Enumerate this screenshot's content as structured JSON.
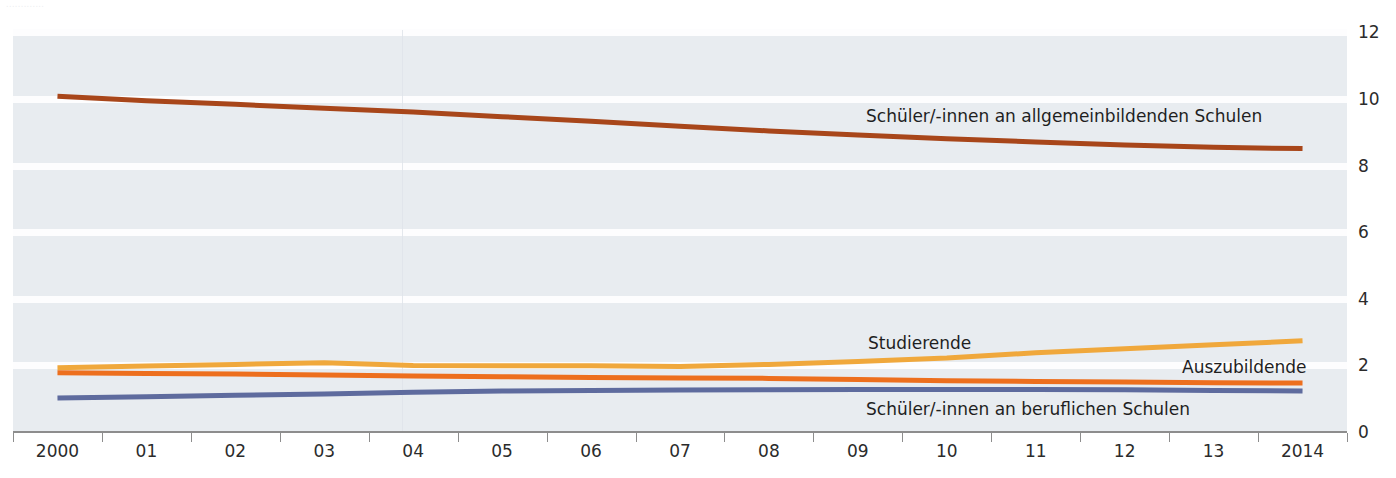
{
  "caption": {
    "top_note": "............."
  },
  "axes": {
    "y_ticks": [
      "0",
      "2",
      "4",
      "6",
      "8",
      "10",
      "12"
    ],
    "y_tick_values": [
      0,
      2,
      4,
      6,
      8,
      10,
      12
    ],
    "x_ticks": [
      "2000",
      "01",
      "02",
      "03",
      "04",
      "05",
      "06",
      "07",
      "08",
      "09",
      "10",
      "11",
      "12",
      "13",
      "2014"
    ]
  },
  "colors": {
    "background": "#e8ecf0",
    "gridband": "#fdfdfe",
    "axis": "#8d8d8d",
    "schueler_allgemeinbildend": "#a8461a",
    "studierende": "#f0a83c",
    "auszubildende": "#ed6f1e",
    "schueler_beruflich": "#5e6b9e",
    "label_text": "#1f1f1f"
  },
  "labels": {
    "schueler_allgemeinbildend": "Schüler/-innen an allgemeinbildenden Schulen",
    "studierende": "Studierende",
    "auszubildende": "Auszubildende",
    "schueler_beruflich": "Schüler/-innen an beruflichen Schulen"
  },
  "chart_data": {
    "type": "line",
    "title": "",
    "subtitle": "",
    "xlabel": "",
    "ylabel": "",
    "ylim": [
      0,
      12
    ],
    "grid": true,
    "legend_position": "inline-labels",
    "x": [
      "2000",
      "01",
      "02",
      "03",
      "04",
      "05",
      "06",
      "07",
      "08",
      "09",
      "10",
      "11",
      "12",
      "13",
      "2014"
    ],
    "x_values": [
      2000,
      2001,
      2002,
      2003,
      2004,
      2005,
      2006,
      2007,
      2008,
      2009,
      2010,
      2011,
      2012,
      2013,
      2014
    ],
    "series": [
      {
        "name": "Schüler/-innen an allgemeinbildenden Schulen",
        "color": "#a8461a",
        "values": [
          10.08,
          9.95,
          9.84,
          9.72,
          9.61,
          9.47,
          9.33,
          9.18,
          9.04,
          8.92,
          8.81,
          8.71,
          8.62,
          8.55,
          8.51
        ]
      },
      {
        "name": "Studierende",
        "color": "#f0a83c",
        "values": [
          1.93,
          1.98,
          2.03,
          2.08,
          2.0,
          1.99,
          1.99,
          1.97,
          2.03,
          2.12,
          2.22,
          2.38,
          2.5,
          2.62,
          2.74
        ]
      },
      {
        "name": "Auszubildende",
        "color": "#ed6f1e",
        "values": [
          1.78,
          1.76,
          1.74,
          1.71,
          1.68,
          1.66,
          1.64,
          1.62,
          1.61,
          1.58,
          1.54,
          1.52,
          1.5,
          1.48,
          1.47
        ]
      },
      {
        "name": "Schüler/-innen an beruflichen Schulen",
        "color": "#5e6b9e",
        "values": [
          1.02,
          1.06,
          1.1,
          1.14,
          1.19,
          1.23,
          1.25,
          1.26,
          1.27,
          1.28,
          1.28,
          1.28,
          1.27,
          1.25,
          1.23
        ]
      }
    ]
  }
}
